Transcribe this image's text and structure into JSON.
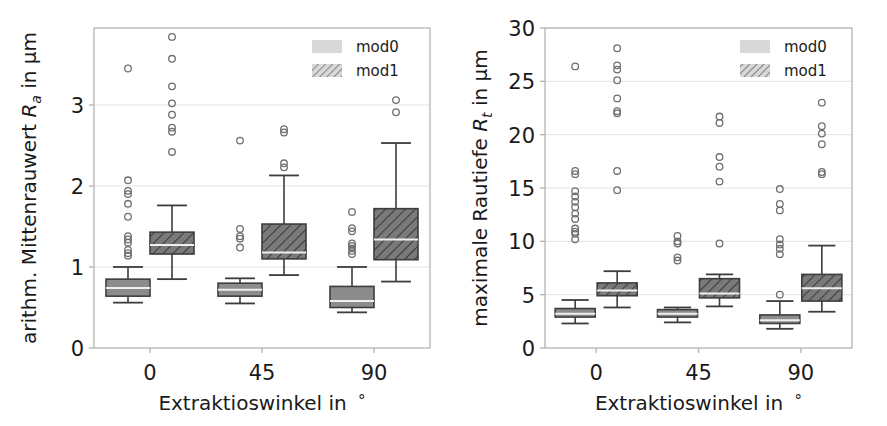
{
  "figure": {
    "background": "#ffffff",
    "panel_count": 2
  },
  "legend": {
    "entries": [
      {
        "label": "mod0",
        "style": "solid-light-gray",
        "color": "#cfcfcf"
      },
      {
        "label": "mod1",
        "style": "hatched-diagonal",
        "color": "#a0a0a0"
      }
    ],
    "position": "upper-right"
  },
  "chart_data": [
    {
      "type": "box",
      "panel": "left",
      "title": "",
      "xlabel_parts": {
        "pre": "Extraktioswinkel in ",
        "unit": "°"
      },
      "ylabel_parts": {
        "pre": "arithm. Mittenrauwert ",
        "symbol": "R",
        "sub": "a",
        "post": " in µm"
      },
      "xlabel": "Extraktioswinkel in °",
      "ylabel": "arithm. Mittenrauwert R_a in µm",
      "categories": [
        "0",
        "45",
        "90"
      ],
      "xticks": [
        "0",
        "45",
        "90"
      ],
      "yticks": [
        0,
        1,
        2,
        3
      ],
      "ylim": [
        0,
        3.95
      ],
      "grid": true,
      "grid_axis": "y",
      "series": [
        {
          "name": "mod0",
          "fill": "#8c8c8c",
          "hatch": "none",
          "boxes": [
            {
              "category": "0",
              "whisker_low": 0.56,
              "q1": 0.64,
              "median": 0.74,
              "q3": 0.85,
              "whisker_high": 1.0,
              "outliers": [
                3.45,
                2.07,
                1.94,
                1.9,
                1.78,
                1.62,
                1.38,
                1.34,
                1.3,
                1.21,
                1.17,
                1.14
              ]
            },
            {
              "category": "45",
              "whisker_low": 0.55,
              "q1": 0.64,
              "median": 0.72,
              "q3": 0.8,
              "whisker_high": 0.86,
              "outliers": [
                2.56,
                1.47,
                1.38,
                1.35,
                1.24
              ]
            },
            {
              "category": "90",
              "whisker_low": 0.44,
              "q1": 0.5,
              "median": 0.58,
              "q3": 0.76,
              "whisker_high": 1.0,
              "outliers": [
                1.68,
                1.48,
                1.44,
                1.29,
                1.26,
                1.23,
                1.2,
                1.16
              ]
            }
          ]
        },
        {
          "name": "mod1",
          "fill": "#7a7a7a",
          "hatch": "diagonal",
          "boxes": [
            {
              "category": "0",
              "whisker_low": 0.85,
              "q1": 1.16,
              "median": 1.27,
              "q3": 1.43,
              "whisker_high": 1.76,
              "outliers": [
                3.84,
                3.57,
                3.23,
                3.02,
                2.88,
                2.72,
                2.67,
                2.42
              ]
            },
            {
              "category": "45",
              "whisker_low": 0.9,
              "q1": 1.1,
              "median": 1.18,
              "q3": 1.53,
              "whisker_high": 2.13,
              "outliers": [
                2.7,
                2.66,
                2.28,
                2.23
              ]
            },
            {
              "category": "90",
              "whisker_low": 0.82,
              "q1": 1.09,
              "median": 1.34,
              "q3": 1.72,
              "whisker_high": 2.53,
              "outliers": [
                3.06,
                2.91
              ]
            }
          ]
        }
      ]
    },
    {
      "type": "box",
      "panel": "right",
      "title": "",
      "xlabel_parts": {
        "pre": "Extraktioswinkel in ",
        "unit": "°"
      },
      "ylabel_parts": {
        "pre": "maximale Rautiefe ",
        "symbol": "R",
        "sub": "t",
        "post": " in µm"
      },
      "xlabel": "Extraktioswinkel in °",
      "ylabel": "maximale Rautiefe R_t in µm",
      "categories": [
        "0",
        "45",
        "90"
      ],
      "xticks": [
        "0",
        "45",
        "90"
      ],
      "yticks": [
        0,
        5,
        10,
        15,
        20,
        25,
        30
      ],
      "ylim": [
        0,
        30
      ],
      "grid": true,
      "grid_axis": "y",
      "series": [
        {
          "name": "mod0",
          "fill": "#8c8c8c",
          "hatch": "none",
          "boxes": [
            {
              "category": "0",
              "whisker_low": 2.3,
              "q1": 2.9,
              "median": 3.2,
              "q3": 3.7,
              "whisker_high": 4.5,
              "outliers": [
                26.4,
                16.6,
                16.3,
                14.7,
                14.2,
                13.7,
                13.2,
                12.6,
                12.1,
                11.2,
                10.9,
                10.7,
                10.2
              ]
            },
            {
              "category": "45",
              "whisker_low": 2.4,
              "q1": 2.9,
              "median": 3.2,
              "q3": 3.6,
              "whisker_high": 3.8,
              "outliers": [
                10.5,
                10.0,
                9.8,
                8.5,
                8.2
              ]
            },
            {
              "category": "90",
              "whisker_low": 1.8,
              "q1": 2.3,
              "median": 2.6,
              "q3": 3.1,
              "whisker_high": 4.4,
              "outliers": [
                14.9,
                13.5,
                12.9,
                10.2,
                9.7,
                9.3,
                8.8,
                5.0
              ]
            }
          ]
        },
        {
          "name": "mod1",
          "fill": "#7a7a7a",
          "hatch": "diagonal",
          "boxes": [
            {
              "category": "0",
              "whisker_low": 3.8,
              "q1": 4.9,
              "median": 5.4,
              "q3": 6.1,
              "whisker_high": 7.2,
              "outliers": [
                28.1,
                26.5,
                26.1,
                25.1,
                23.4,
                22.2,
                22.0,
                16.6,
                14.8
              ]
            },
            {
              "category": "45",
              "whisker_low": 3.9,
              "q1": 4.7,
              "median": 5.1,
              "q3": 6.5,
              "whisker_high": 6.9,
              "outliers": [
                21.7,
                21.1,
                17.9,
                17.0,
                15.6,
                9.8
              ]
            },
            {
              "category": "90",
              "whisker_low": 3.4,
              "q1": 4.4,
              "median": 5.6,
              "q3": 6.9,
              "whisker_high": 9.6,
              "outliers": [
                23.0,
                20.8,
                20.1,
                19.1,
                16.5,
                16.3
              ]
            }
          ]
        }
      ]
    }
  ]
}
